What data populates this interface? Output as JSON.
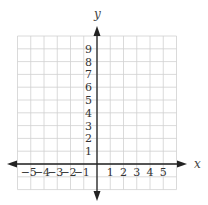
{
  "chart_data": {
    "type": "scatter",
    "title": "",
    "xlabel": "x",
    "ylabel": "y",
    "xlim": [
      -6,
      6
    ],
    "ylim": [
      -2,
      10
    ],
    "grid": true,
    "legend": null,
    "x_tick_labels": [
      "−5",
      "−4",
      "−3",
      "−2",
      "−1",
      "1",
      "2",
      "3",
      "4",
      "5"
    ],
    "x_ticks": [
      -5,
      -4,
      -3,
      -2,
      -1,
      1,
      2,
      3,
      4,
      5
    ],
    "y_tick_labels": [
      "1",
      "2",
      "3",
      "4",
      "5",
      "6",
      "7",
      "8",
      "9"
    ],
    "y_ticks": [
      1,
      2,
      3,
      4,
      5,
      6,
      7,
      8,
      9
    ],
    "series": []
  },
  "colors": {
    "grid": "#d0d0d0",
    "axis": "#222222",
    "text": "#333333"
  }
}
